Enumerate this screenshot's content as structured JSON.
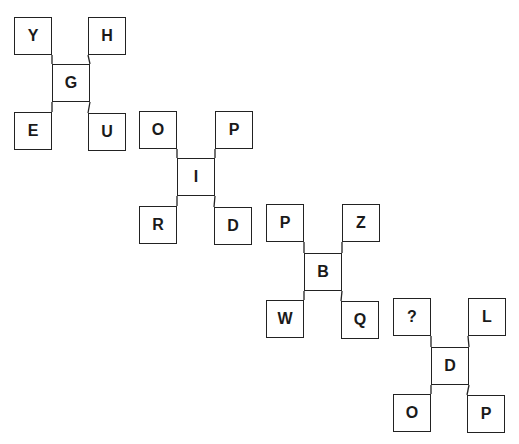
{
  "colors": {
    "background": "#ffffff",
    "stroke": "#222222",
    "text": "#1a1a1a"
  },
  "groups": [
    {
      "center": "G",
      "top_left": "Y",
      "top_right": "H",
      "bottom_left": "E",
      "bottom_right": "U",
      "pos": {
        "center": [
          52,
          64
        ],
        "top_left": [
          14,
          17
        ],
        "top_right": [
          88,
          17
        ],
        "bottom_left": [
          14,
          112
        ],
        "bottom_right": [
          88,
          113
        ]
      }
    },
    {
      "center": "I",
      "top_left": "O",
      "top_right": "P",
      "bottom_left": "R",
      "bottom_right": "D",
      "pos": {
        "center": [
          177,
          158
        ],
        "top_left": [
          139,
          111
        ],
        "top_right": [
          215,
          111
        ],
        "bottom_left": [
          139,
          206
        ],
        "bottom_right": [
          214,
          207
        ]
      }
    },
    {
      "center": "B",
      "top_left": "P",
      "top_right": "Z",
      "bottom_left": "W",
      "bottom_right": "Q",
      "pos": {
        "center": [
          304,
          253
        ],
        "top_left": [
          266,
          204
        ],
        "top_right": [
          342,
          204
        ],
        "bottom_left": [
          266,
          300
        ],
        "bottom_right": [
          341,
          301
        ]
      }
    },
    {
      "center": "D",
      "top_left": "?",
      "top_right": "L",
      "bottom_left": "O",
      "bottom_right": "P",
      "pos": {
        "center": [
          431,
          347
        ],
        "top_left": [
          393,
          298
        ],
        "top_right": [
          468,
          298
        ],
        "bottom_left": [
          393,
          394
        ],
        "bottom_right": [
          467,
          395
        ]
      }
    }
  ]
}
